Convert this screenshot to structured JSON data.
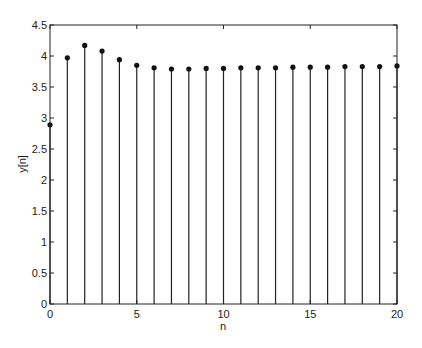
{
  "chart_data": {
    "type": "stem",
    "title": "",
    "xlabel": "n",
    "ylabel": "y[n]",
    "xlim": [
      0,
      20
    ],
    "ylim": [
      0,
      4.5
    ],
    "grid": false,
    "x": [
      0,
      1,
      2,
      3,
      4,
      5,
      6,
      7,
      8,
      9,
      10,
      11,
      12,
      13,
      14,
      15,
      16,
      17,
      18,
      19,
      20
    ],
    "values": [
      2.89,
      3.97,
      4.17,
      4.08,
      3.94,
      3.85,
      3.81,
      3.79,
      3.79,
      3.8,
      3.8,
      3.81,
      3.81,
      3.81,
      3.82,
      3.82,
      3.82,
      3.83,
      3.83,
      3.83,
      3.84
    ],
    "xticks": [
      "0",
      "5",
      "10",
      "15",
      "20"
    ],
    "yticks": [
      "0",
      "0.5",
      "1",
      "1.5",
      "2",
      "2.5",
      "3",
      "3.5",
      "4",
      "4.5"
    ]
  }
}
